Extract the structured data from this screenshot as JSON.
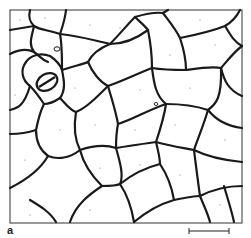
{
  "figure": {
    "panel_label": "a",
    "scale_bar": {
      "present": true,
      "label": ""
    },
    "colors": {
      "wall": "#1a1a1a",
      "background": "#ffffff",
      "stipple": "#555555"
    }
  }
}
